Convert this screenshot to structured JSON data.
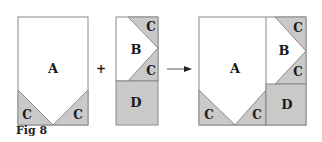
{
  "caption": "Fig 8",
  "colors": {
    "fill_shaded": "#c9c9c9",
    "fill_white": "#ffffff",
    "stroke": "#8a8a8a",
    "text": "#1a1a1a"
  },
  "operators": {
    "plus": "+",
    "arrow": "→"
  },
  "unit1": {
    "labels": {
      "A": "A",
      "C_left": "C",
      "C_right": "C"
    }
  },
  "unit2": {
    "labels": {
      "B": "B",
      "C_top": "C",
      "C_bottom": "C",
      "D": "D"
    }
  },
  "combined": {
    "labels": {
      "A": "A",
      "C_left": "C",
      "C_mid": "C",
      "B": "B",
      "C_top": "C",
      "C_bottom": "C",
      "D": "D"
    }
  }
}
